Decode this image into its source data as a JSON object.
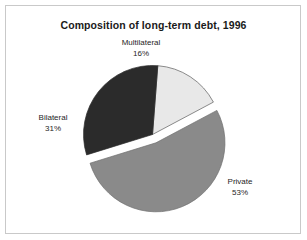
{
  "figure": {
    "title": "Composition of long-term debt, 1996",
    "background_color": "#ffffff",
    "border_color": "#c9c9c9"
  },
  "chart_data": {
    "type": "pie",
    "title": "Composition of long-term debt, 1996",
    "xlabel": "",
    "ylabel": "",
    "legend_position": "none",
    "grid": false,
    "labels_inline": true,
    "categories": [
      "Multilateral",
      "Bilateral",
      "Private"
    ],
    "values": [
      16,
      31,
      53
    ],
    "value_unit": "%",
    "slices": [
      {
        "name": "Multilateral",
        "label": "Multilateral",
        "value": 16,
        "value_label": "16%",
        "color": "#e8e8e8",
        "exploded": false,
        "label_position": "top"
      },
      {
        "name": "Bilateral",
        "label": "Bilateral",
        "value": 31,
        "value_label": "31%",
        "color": "#2b2b2b",
        "exploded": false,
        "label_position": "left"
      },
      {
        "name": "Private",
        "label": "Private",
        "value": 53,
        "value_label": "53%",
        "color": "#8a8a8a",
        "exploded": true,
        "label_position": "right"
      }
    ]
  }
}
